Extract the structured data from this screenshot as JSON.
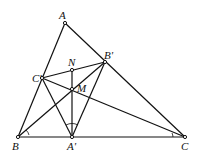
{
  "diagram": {
    "points": {
      "A": {
        "label": "A",
        "x": 65,
        "y": 23
      },
      "Bp": {
        "label": "B'",
        "x": 105,
        "y": 62
      },
      "N": {
        "label": "N",
        "x": 72,
        "y": 70
      },
      "Cp": {
        "label": "C'",
        "x": 42,
        "y": 78
      },
      "M": {
        "label": "M",
        "x": 72,
        "y": 89
      },
      "B": {
        "label": "B",
        "x": 18,
        "y": 137
      },
      "Ap": {
        "label": "A'",
        "x": 72,
        "y": 137
      },
      "C": {
        "label": "C",
        "x": 185,
        "y": 137
      }
    },
    "segments": [
      [
        "A",
        "B"
      ],
      [
        "A",
        "C"
      ],
      [
        "B",
        "C"
      ],
      [
        "B",
        "Bp"
      ],
      [
        "C",
        "Cp"
      ],
      [
        "Ap",
        "Bp"
      ],
      [
        "Ap",
        "Cp"
      ],
      [
        "Cp",
        "Bp"
      ],
      [
        "N",
        "Ap"
      ]
    ]
  }
}
